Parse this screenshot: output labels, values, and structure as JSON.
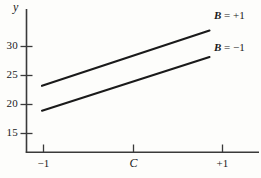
{
  "chart_data": {
    "type": "line",
    "title": "",
    "subtitle": "",
    "xlabel": "",
    "ylabel": "y",
    "xlim": [
      -1,
      1
    ],
    "ylim": [
      13.2,
      35.3
    ],
    "grid": false,
    "legend_position": "right-of-line-ends",
    "x_ticks": [
      {
        "value": -1,
        "label": "−1",
        "italic": false
      },
      {
        "value": 0,
        "label": "C",
        "italic": true
      },
      {
        "value": 1,
        "label": "+1",
        "italic": false
      }
    ],
    "y_ticks": [
      {
        "value": 15,
        "label": "15"
      },
      {
        "value": 20,
        "label": "20"
      },
      {
        "value": 25,
        "label": "25"
      },
      {
        "value": 30,
        "label": "30"
      }
    ],
    "series": [
      {
        "name": "B = +1",
        "label_var": "B",
        "label_rest": " = +1",
        "x": [
          -1,
          1
        ],
        "values": [
          23.3,
          33.5
        ]
      },
      {
        "name": "B = −1",
        "label_var": "B",
        "label_rest": " = −1",
        "x": [
          -1,
          1
        ],
        "values": [
          19.0,
          28.9
        ]
      }
    ],
    "colors": {
      "line": "#1a1a1a",
      "axis": "#3a3a3a",
      "text": "#1a1a1a",
      "background": "#fdfdfb"
    }
  },
  "axis": {
    "y_axis_name": "y"
  },
  "annotations": {
    "series_1_label": "B = +1",
    "series_2_label": "B = −1"
  }
}
